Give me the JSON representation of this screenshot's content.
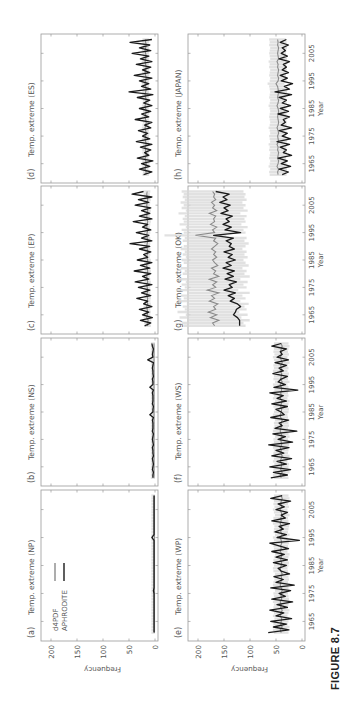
{
  "figure": {
    "caption": "FIGURE 8.7",
    "orientation": "rotated -90 degrees (landscape figure on portrait page)",
    "colors": {
      "d4PDF": "#8a8a8a",
      "d4PDF_spread": "#d8d8d8",
      "APHRODITE": "#1a1a1a",
      "axis": "#9a9a9a",
      "text": "#555555"
    }
  },
  "legend": {
    "items": [
      {
        "label": "d4PDF",
        "color": "#8a8a8a"
      },
      {
        "label": "APHRODITE",
        "color": "#1a1a1a"
      }
    ]
  },
  "chart_data": [
    {
      "type": "line",
      "panel": "(a)",
      "title": "Temp. extreme (NP)",
      "xlabel": "",
      "ylabel": "Frequency",
      "xlim": [
        1958,
        2012
      ],
      "ylim": [
        0,
        225
      ],
      "xticks": [
        1965,
        1975,
        1985,
        1995,
        2005
      ],
      "yticks": [
        0,
        50,
        100,
        150,
        200
      ],
      "x_start": 1961,
      "x_end": 2010,
      "series": [
        {
          "name": "d4PDF",
          "values": [
            1,
            1,
            1,
            1,
            1,
            1,
            1,
            1,
            1,
            1,
            1,
            1,
            1,
            1,
            1,
            1,
            1,
            1,
            1,
            1,
            1,
            1,
            1,
            1,
            1,
            1,
            1,
            1,
            1,
            1,
            1,
            1,
            1,
            1,
            1,
            1,
            1,
            1,
            1,
            1,
            1,
            1,
            1,
            1,
            1,
            1,
            1,
            1,
            1,
            1
          ]
        },
        {
          "name": "APHRODITE",
          "values": [
            2,
            2,
            2,
            2,
            2,
            2,
            2,
            2,
            2,
            2,
            2,
            2,
            2,
            2,
            2,
            3,
            2,
            2,
            2,
            2,
            2,
            2,
            2,
            2,
            2,
            2,
            2,
            2,
            2,
            2,
            2,
            2,
            2,
            2,
            6,
            2,
            2,
            2,
            2,
            2,
            2,
            2,
            2,
            2,
            2,
            2,
            2,
            2,
            2,
            2
          ]
        }
      ]
    },
    {
      "type": "line",
      "panel": "(b)",
      "title": "Temp. extreme (NS)",
      "xlabel": "",
      "ylabel": "",
      "xlim": [
        1958,
        2012
      ],
      "ylim": [
        0,
        225
      ],
      "xticks": [
        1965,
        1975,
        1985,
        1995,
        2005
      ],
      "yticks": [
        0,
        50,
        100,
        150,
        200
      ],
      "x_start": 1961,
      "x_end": 2010,
      "series": [
        {
          "name": "d4PDF",
          "values": [
            2,
            2,
            2,
            2,
            2,
            2,
            2,
            2,
            2,
            2,
            2,
            2,
            2,
            2,
            2,
            2,
            2,
            2,
            2,
            2,
            2,
            2,
            2,
            2,
            2,
            2,
            2,
            2,
            2,
            2,
            2,
            2,
            2,
            2,
            2,
            2,
            2,
            2,
            2,
            2,
            2,
            2,
            2,
            2,
            2,
            2,
            2,
            2,
            2,
            2
          ]
        },
        {
          "name": "APHRODITE",
          "values": [
            4,
            4,
            3,
            5,
            4,
            3,
            4,
            5,
            3,
            4,
            4,
            5,
            3,
            4,
            5,
            4,
            3,
            5,
            4,
            4,
            4,
            5,
            3,
            10,
            4,
            4,
            3,
            5,
            4,
            4,
            4,
            5,
            3,
            10,
            4,
            4,
            5,
            3,
            4,
            4,
            5,
            4,
            3,
            14,
            4,
            5,
            4,
            3,
            5,
            6
          ]
        }
      ]
    },
    {
      "type": "line",
      "panel": "(c)",
      "title": "Temp. extreme (EP)",
      "xlabel": "",
      "ylabel": "",
      "xlim": [
        1958,
        2012
      ],
      "ylim": [
        0,
        225
      ],
      "xticks": [
        1965,
        1975,
        1985,
        1995,
        2005
      ],
      "yticks": [
        0,
        50,
        100,
        150,
        200
      ],
      "x_start": 1961,
      "x_end": 2010,
      "series": [
        {
          "name": "d4PDF",
          "values": [
            14,
            15,
            13,
            16,
            15,
            14,
            15,
            16,
            14,
            15,
            14,
            16,
            15,
            14,
            15,
            16,
            14,
            15,
            16,
            15,
            14,
            15,
            16,
            15,
            14,
            16,
            15,
            14,
            15,
            16,
            15,
            14,
            15,
            16,
            15,
            14,
            16,
            15,
            14,
            15,
            16,
            15,
            14,
            15,
            16,
            15,
            14,
            15,
            16,
            15
          ]
        },
        {
          "name": "APHRODITE",
          "values": [
            20,
            8,
            28,
            5,
            24,
            12,
            30,
            6,
            22,
            14,
            35,
            8,
            26,
            10,
            32,
            6,
            38,
            12,
            24,
            8,
            40,
            10,
            28,
            6,
            34,
            14,
            22,
            8,
            30,
            10,
            48,
            6,
            26,
            12,
            36,
            8,
            24,
            14,
            42,
            6,
            30,
            10,
            26,
            8,
            38,
            12,
            32,
            6,
            44,
            22
          ]
        }
      ]
    },
    {
      "type": "line",
      "panel": "(d)",
      "title": "Temp. extreme (ES)",
      "xlabel": "",
      "ylabel": "",
      "xlim": [
        1958,
        2012
      ],
      "ylim": [
        0,
        225
      ],
      "xticks": [
        1965,
        1975,
        1985,
        1995,
        2005
      ],
      "yticks": [
        0,
        50,
        100,
        150,
        200
      ],
      "x_start": 1961,
      "x_end": 2010,
      "series": [
        {
          "name": "d4PDF",
          "values": [
            18,
            17,
            19,
            18,
            17,
            18,
            19,
            17,
            18,
            18,
            19,
            17,
            18,
            19,
            18,
            17,
            18,
            19,
            18,
            17,
            18,
            19,
            18,
            17,
            18,
            19,
            18,
            17,
            18,
            19,
            18,
            17,
            18,
            19,
            18,
            17,
            18,
            19,
            18,
            17,
            18,
            19,
            18,
            17,
            18,
            19,
            18,
            17,
            18,
            18
          ]
        },
        {
          "name": "APHRODITE",
          "values": [
            22,
            6,
            30,
            10,
            26,
            4,
            34,
            12,
            20,
            8,
            28,
            6,
            36,
            10,
            24,
            14,
            32,
            8,
            20,
            6,
            38,
            12,
            26,
            8,
            30,
            6,
            22,
            10,
            34,
            4,
            50,
            8,
            26,
            12,
            30,
            6,
            40,
            10,
            24,
            8,
            36,
            6,
            28,
            12,
            44,
            8,
            30,
            10,
            48,
            6
          ]
        }
      ]
    },
    {
      "type": "line",
      "panel": "(e)",
      "title": "Temp. extreme (WP)",
      "xlabel": "Year",
      "ylabel": "Frequency",
      "xlim": [
        1958,
        2012
      ],
      "ylim": [
        0,
        225
      ],
      "xticks": [
        1965,
        1975,
        1985,
        1995,
        2005
      ],
      "yticks": [
        0,
        50,
        100,
        150,
        200
      ],
      "x_start": 1961,
      "x_end": 2010,
      "series": [
        {
          "name": "d4PDF",
          "values": [
            40,
            42,
            38,
            41,
            40,
            39,
            42,
            40,
            38,
            41,
            40,
            42,
            39,
            40,
            41,
            38,
            40,
            42,
            41,
            39,
            40,
            38,
            41,
            42,
            40,
            39,
            41,
            40,
            38,
            42,
            40,
            41,
            39,
            40,
            42,
            38,
            41,
            40,
            39,
            42,
            40,
            41,
            38,
            40,
            42,
            39,
            41,
            40,
            38,
            40
          ]
        },
        {
          "name": "APHRODITE",
          "values": [
            65,
            25,
            55,
            30,
            60,
            20,
            50,
            35,
            62,
            28,
            48,
            18,
            58,
            32,
            44,
            22,
            60,
            15,
            50,
            36,
            54,
            24,
            40,
            46,
            30,
            55,
            28,
            50,
            34,
            58,
            26,
            44,
            62,
            5,
            48,
            30,
            52,
            36,
            44,
            24,
            58,
            32,
            40,
            28,
            50,
            34,
            46,
            22,
            60,
            38
          ]
        }
      ]
    },
    {
      "type": "line",
      "panel": "(f)",
      "title": "Temp. extreme (WS)",
      "xlabel": "Year",
      "ylabel": "",
      "xlim": [
        1958,
        2012
      ],
      "ylim": [
        0,
        225
      ],
      "xticks": [
        1965,
        1975,
        1985,
        1995,
        2005
      ],
      "yticks": [
        0,
        50,
        100,
        150,
        200
      ],
      "x_start": 1961,
      "x_end": 2010,
      "series": [
        {
          "name": "d4PDF",
          "values": [
            40,
            42,
            38,
            41,
            40,
            39,
            42,
            40,
            38,
            41,
            40,
            42,
            39,
            40,
            41,
            38,
            40,
            42,
            41,
            39,
            40,
            38,
            41,
            42,
            40,
            39,
            41,
            40,
            38,
            42,
            40,
            41,
            39,
            40,
            42,
            38,
            41,
            40,
            39,
            42,
            40,
            41,
            38,
            40,
            42,
            39,
            41,
            40,
            38,
            40
          ]
        },
        {
          "name": "APHRODITE",
          "values": [
            60,
            28,
            55,
            22,
            62,
            30,
            48,
            20,
            58,
            35,
            50,
            25,
            64,
            18,
            46,
            32,
            56,
            10,
            52,
            38,
            44,
            26,
            60,
            34,
            40,
            50,
            28,
            58,
            30,
            48,
            36,
            62,
            8,
            54,
            32,
            46,
            40,
            28,
            56,
            36,
            44,
            30,
            52,
            26,
            48,
            38,
            42,
            30,
            58,
            40
          ]
        }
      ]
    },
    {
      "type": "line",
      "panel": "(g)",
      "title": "Temp. extreme (OK)",
      "xlabel": "Year",
      "ylabel": "",
      "xlim": [
        1958,
        2012
      ],
      "ylim": [
        0,
        225
      ],
      "xticks": [
        1965,
        1975,
        1985,
        1995,
        2005
      ],
      "yticks": [
        0,
        50,
        100,
        150,
        200
      ],
      "x_start": 1961,
      "x_end": 2010,
      "series": [
        {
          "name": "d4PDF",
          "values": [
            168,
            172,
            160,
            176,
            164,
            180,
            166,
            170,
            162,
            178,
            168,
            174,
            160,
            182,
            166,
            172,
            164,
            178,
            160,
            170,
            166,
            174,
            162,
            168,
            172,
            164,
            170,
            166,
            174,
            168,
            162,
            170,
            166,
            205,
            168,
            172,
            164,
            176,
            168,
            170,
            166,
            178,
            164,
            172,
            168,
            174,
            166,
            170,
            168,
            172
          ]
        },
        {
          "name": "APHRODITE",
          "values": [
            120,
            120,
            120,
            124,
            132,
            128,
            126,
            118,
            124,
            138,
            130,
            142,
            128,
            150,
            134,
            140,
            126,
            148,
            132,
            144,
            130,
            152,
            136,
            146,
            128,
            142,
            134,
            150,
            130,
            140,
            136,
            146,
            132,
            170,
            118,
            148,
            136,
            152,
            140,
            146,
            134,
            156,
            142,
            150,
            138,
            158,
            144,
            152,
            140,
            166
          ]
        }
      ]
    },
    {
      "type": "line",
      "panel": "(h)",
      "title": "Temp. extreme (JAPAN)",
      "xlabel": "Year",
      "ylabel": "",
      "xlim": [
        1958,
        2012
      ],
      "ylim": [
        0,
        225
      ],
      "xticks": [
        1965,
        1975,
        1985,
        1995,
        2005
      ],
      "yticks": [
        0,
        50,
        100,
        150,
        200
      ],
      "x_start": 1961,
      "x_end": 2010,
      "series": [
        {
          "name": "d4PDF",
          "values": [
            46,
            47,
            45,
            48,
            46,
            45,
            47,
            46,
            45,
            47,
            46,
            48,
            45,
            46,
            47,
            45,
            46,
            48,
            46,
            45,
            46,
            47,
            46,
            45,
            46,
            48,
            46,
            45,
            47,
            46,
            45,
            46,
            47,
            50,
            46,
            45,
            47,
            46,
            45,
            47,
            46,
            48,
            45,
            46,
            47,
            46,
            45,
            47,
            46,
            47
          ]
        },
        {
          "name": "APHRODITE",
          "values": [
            38,
            26,
            44,
            22,
            40,
            28,
            46,
            20,
            36,
            30,
            42,
            24,
            48,
            22,
            38,
            28,
            44,
            20,
            40,
            32,
            36,
            24,
            46,
            26,
            42,
            22,
            38,
            30,
            44,
            20,
            52,
            24,
            34,
            18,
            40,
            28,
            42,
            26,
            38,
            30,
            36,
            24,
            44,
            28,
            40,
            32,
            38,
            26,
            42,
            30
          ]
        }
      ]
    }
  ],
  "panels": [
    {
      "id": "a",
      "label": "(a)",
      "title": "Temp. extreme (NP)"
    },
    {
      "id": "b",
      "label": "(b)",
      "title": "Temp. extreme (NS)"
    },
    {
      "id": "c",
      "label": "(c)",
      "title": "Temp. extreme (EP)"
    },
    {
      "id": "d",
      "label": "(d)",
      "title": "Temp. extreme (ES)"
    },
    {
      "id": "e",
      "label": "(e)",
      "title": "Temp. extreme (WP)"
    },
    {
      "id": "f",
      "label": "(f)",
      "title": "Temp. extreme (WS)"
    },
    {
      "id": "g",
      "label": "(g)",
      "title": "Temp. extreme (OK)"
    },
    {
      "id": "h",
      "label": "(h)",
      "title": "Temp. extreme (JAPAN)"
    }
  ],
  "axes": {
    "ylabel": "Frequency",
    "xlabel": "Year",
    "yticks": [
      "0",
      "50",
      "100",
      "150",
      "200"
    ],
    "xticks": [
      "1965",
      "1975",
      "1985",
      "1995",
      "2005"
    ]
  }
}
